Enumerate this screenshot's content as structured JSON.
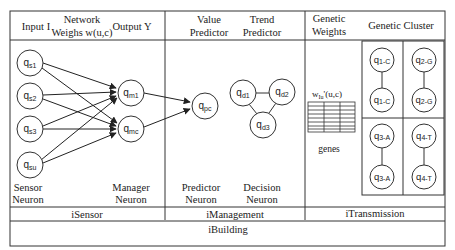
{
  "header": {
    "isensor": {
      "input_label": "Input I",
      "weights_label_line1": "Network",
      "weights_label_line2": "Weighs w(u,c)",
      "output_label": "Output Y"
    },
    "imanagement": {
      "value_line1": "Value",
      "value_line2": "Predictor",
      "trend_line1": "Trend",
      "trend_line2": "Predictor"
    },
    "itransmission": {
      "weights_line1": "Genetic",
      "weights_line2": "Weights",
      "cluster_label": "Genetic Cluster"
    }
  },
  "isensor": {
    "sensor_nodes": [
      {
        "base": "q",
        "sub": "s1"
      },
      {
        "base": "q",
        "sub": "s2"
      },
      {
        "base": "q",
        "sub": "s3"
      },
      {
        "base": "q",
        "sub": "su"
      }
    ],
    "manager_nodes": [
      {
        "base": "q",
        "sub": "m1"
      },
      {
        "base": "q",
        "sub": "mc"
      }
    ],
    "sensor_caption_line1": "Sensor",
    "sensor_caption_line2": "Neuron",
    "manager_caption_line1": "Manager",
    "manager_caption_line2": "Neuron"
  },
  "imanagement": {
    "predictor_node": {
      "base": "q",
      "sub": "pc"
    },
    "decision_nodes": [
      {
        "base": "q",
        "sub": "d1"
      },
      {
        "base": "q",
        "sub": "d2"
      },
      {
        "base": "q",
        "sub": "d3"
      }
    ],
    "predictor_caption_line1": "Predictor",
    "predictor_caption_line2": "Neuron",
    "decision_caption_line1": "Decision",
    "decision_caption_line2": "Neuron"
  },
  "itransmission": {
    "weights_formula": "w",
    "weights_formula_sub": "Iu",
    "weights_formula_rest": "'(u,c)",
    "genes_label": "genes",
    "clusters": [
      {
        "top": {
          "base": "q",
          "sub": "1-C"
        },
        "bottom": {
          "base": "q",
          "sub": "1-C"
        }
      },
      {
        "top": {
          "base": "q",
          "sub": "2-G"
        },
        "bottom": {
          "base": "q",
          "sub": "2-G"
        }
      },
      {
        "top": {
          "base": "q",
          "sub": "3-A"
        },
        "bottom": {
          "base": "q",
          "sub": "3-A"
        }
      },
      {
        "top": {
          "base": "q",
          "sub": "4-T"
        },
        "bottom": {
          "base": "q",
          "sub": "4-T"
        }
      }
    ]
  },
  "footer": {
    "isensor_label": "iSensor",
    "imanagement_label": "iManagement",
    "itransmission_label": "iTransmission",
    "ibuilding_label": "iBuilding"
  },
  "colors": {
    "line": "#333333",
    "background": "#ffffff"
  }
}
